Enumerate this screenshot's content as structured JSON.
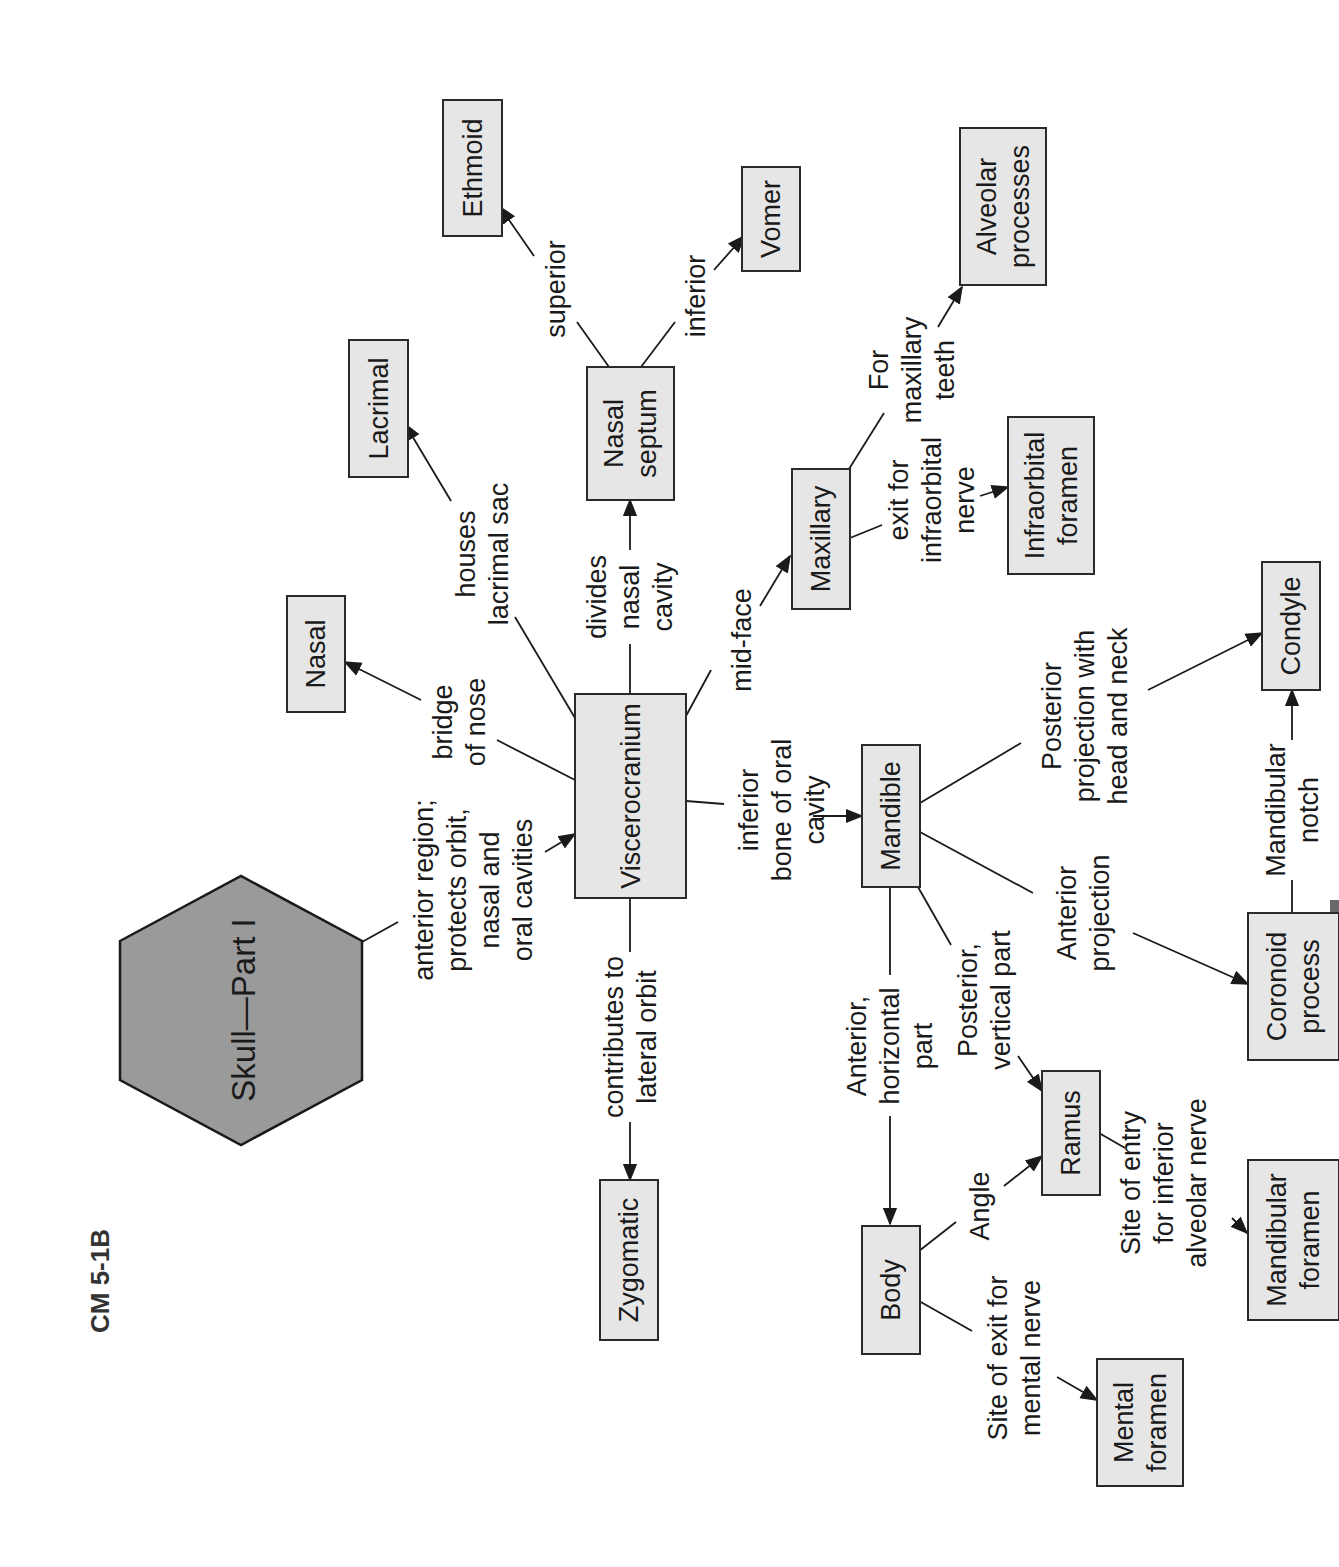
{
  "figure": {
    "id_label": "CM 5-1B",
    "orientation": "rotated -90deg (text reads bottom-to-top)",
    "colors": {
      "background": "#ffffff",
      "node_fill": "#e6e6e6",
      "root_fill": "#9a9a9a",
      "stroke": "#1a1a1a"
    }
  },
  "root": {
    "id": "skull",
    "label": "Skull—Part I",
    "shape": "hexagon"
  },
  "nodes": {
    "viscerocranium": {
      "lines": [
        "Viscerocranium"
      ]
    },
    "nasal": {
      "lines": [
        "Nasal"
      ]
    },
    "lacrimal": {
      "lines": [
        "Lacrimal"
      ]
    },
    "nasal_septum": {
      "lines": [
        "Nasal",
        "septum"
      ]
    },
    "ethmoid": {
      "lines": [
        "Ethmoid"
      ]
    },
    "vomer": {
      "lines": [
        "Vomer"
      ]
    },
    "maxillary": {
      "lines": [
        "Maxillary"
      ]
    },
    "alveolar_processes": {
      "lines": [
        "Alveolar",
        "processes"
      ]
    },
    "infraorbital_foramen": {
      "lines": [
        "Infraorbital",
        "foramen"
      ]
    },
    "zygomatic": {
      "lines": [
        "Zygomatic"
      ]
    },
    "mandible": {
      "lines": [
        "Mandible"
      ]
    },
    "condyle": {
      "lines": [
        "Condyle"
      ]
    },
    "coronoid_process": {
      "lines": [
        "Coronoid",
        "process"
      ]
    },
    "ramus": {
      "lines": [
        "Ramus"
      ]
    },
    "body": {
      "lines": [
        "Body"
      ]
    },
    "mandibular_foramen": {
      "lines": [
        "Mandibular",
        "foramen"
      ]
    },
    "mental_foramen": {
      "lines": [
        "Mental",
        "foramen"
      ]
    }
  },
  "edges": {
    "skull_viscerocranium": {
      "from": "skull",
      "to": "viscerocranium",
      "lines": [
        "anterior region;",
        "protects orbit,",
        "nasal and",
        "oral cavities"
      ]
    },
    "visc_nasal": {
      "from": "viscerocranium",
      "to": "nasal",
      "lines": [
        "bridge",
        "of nose"
      ]
    },
    "visc_lacrimal": {
      "from": "viscerocranium",
      "to": "lacrimal",
      "lines": [
        "houses",
        "lacrimal sac"
      ]
    },
    "visc_septum": {
      "from": "viscerocranium",
      "to": "nasal_septum",
      "lines": [
        "divides",
        "nasal",
        "cavity"
      ]
    },
    "septum_ethmoid": {
      "from": "nasal_septum",
      "to": "ethmoid",
      "lines": [
        "superior"
      ]
    },
    "septum_vomer": {
      "from": "nasal_septum",
      "to": "vomer",
      "lines": [
        "inferior"
      ]
    },
    "visc_maxillary": {
      "from": "viscerocranium",
      "to": "maxillary",
      "lines": [
        "mid-face"
      ]
    },
    "maxillary_alveolar": {
      "from": "maxillary",
      "to": "alveolar_processes",
      "lines": [
        "For",
        "maxillary",
        "teeth"
      ]
    },
    "maxillary_infraorbital": {
      "from": "maxillary",
      "to": "infraorbital_foramen",
      "lines": [
        "exit for",
        "infraorbital",
        "nerve"
      ]
    },
    "visc_zygomatic": {
      "from": "viscerocranium",
      "to": "zygomatic",
      "lines": [
        "contributes to",
        "lateral orbit"
      ]
    },
    "visc_mandible": {
      "from": "viscerocranium",
      "to": "mandible",
      "lines": [
        "inferior",
        "bone of oral",
        "cavity"
      ]
    },
    "mandible_condyle": {
      "from": "mandible",
      "to": "condyle",
      "lines": [
        "Posterior",
        "projection with",
        "head and neck"
      ]
    },
    "mandible_coronoid": {
      "from": "mandible",
      "to": "coronoid_process",
      "lines": [
        "Anterior",
        "projection"
      ]
    },
    "coronoid_condyle": {
      "from": "coronoid_process",
      "to": "condyle",
      "lines": [
        "Mandibular",
        "notch"
      ]
    },
    "mandible_body": {
      "from": "mandible",
      "to": "body",
      "lines": [
        "Anterior,",
        "horizontal",
        "part"
      ]
    },
    "mandible_ramus": {
      "from": "mandible",
      "to": "ramus",
      "lines": [
        "Posterior,",
        "vertical part"
      ]
    },
    "body_ramus": {
      "from": "body",
      "to": "ramus",
      "lines": [
        "Angle"
      ]
    },
    "ramus_mandibular_foramen": {
      "from": "ramus",
      "to": "mandibular_foramen",
      "lines": [
        "Site of entry",
        "for inferior",
        "alveolar nerve"
      ]
    },
    "body_mental_foramen": {
      "from": "body",
      "to": "mental_foramen",
      "lines": [
        "Site of exit for",
        "mental nerve"
      ]
    }
  }
}
